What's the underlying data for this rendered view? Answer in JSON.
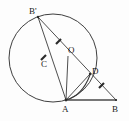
{
  "figure": {
    "background_color": "#fdfdfd",
    "line_color": "#3a3a3a",
    "label_color": "#1a1a1a",
    "width": 129,
    "height": 121
  },
  "labels": {
    "b_prime": "B'",
    "c": "C",
    "o": "O",
    "d": "D",
    "a": "A",
    "b": "B"
  },
  "points": {
    "b_prime": {
      "name": "B'",
      "x": 38,
      "y": 17,
      "label_x": 30,
      "label_y": 14
    },
    "c": {
      "name": "C",
      "x": 47,
      "y": 62,
      "label_x": 42,
      "label_y": 65
    },
    "o": {
      "name": "O",
      "x": 69,
      "y": 57,
      "label_x": 69,
      "label_y": 53
    },
    "d": {
      "name": "D",
      "x": 90,
      "y": 74,
      "label_x": 92,
      "label_y": 73
    },
    "a": {
      "name": "A",
      "x": 66,
      "y": 100,
      "label_x": 63,
      "label_y": 112
    },
    "b": {
      "name": "B",
      "x": 116,
      "y": 100,
      "label_x": 113,
      "label_y": 112
    }
  },
  "circle": {
    "center_x": 53,
    "center_y": 58,
    "radius": 44
  },
  "segments": [
    {
      "name": "b-prime-to-a",
      "from": "b_prime",
      "to": "a",
      "style": "plain"
    },
    {
      "name": "b-prime-to-b",
      "from": "b_prime",
      "to": "b",
      "style": "plain"
    },
    {
      "name": "a-to-o",
      "from": "a",
      "to": "o",
      "style": "plain"
    },
    {
      "name": "a-to-d",
      "from": "a",
      "to": "d",
      "style": "plain"
    },
    {
      "name": "a-to-b",
      "from": "a",
      "to": "b",
      "style": "thick"
    }
  ],
  "arcs": [
    {
      "name": "arc-a-to-d",
      "from": "a",
      "to": "d"
    }
  ],
  "tick_marks": [
    {
      "name": "tick-on-b-prime-a",
      "x": 43,
      "y": 57,
      "angle": -62
    },
    {
      "name": "tick-on-b-prime-d",
      "x": 58,
      "y": 41,
      "angle": -35
    },
    {
      "name": "tick-on-d-b",
      "x": 101,
      "y": 85,
      "angle": -42
    }
  ]
}
